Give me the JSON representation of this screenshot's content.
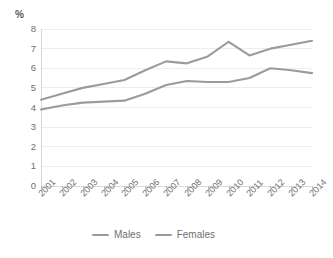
{
  "chart_data": {
    "type": "line",
    "title": "",
    "subtitle": "",
    "xlabel": "",
    "ylabel": "%",
    "unit_label": "%",
    "categories": [
      "2001",
      "2002",
      "2003",
      "2004",
      "2005",
      "2006",
      "2007",
      "2008",
      "2009",
      "2010",
      "2011",
      "2012",
      "2013",
      "2014"
    ],
    "x": [
      2001,
      2002,
      2003,
      2004,
      2005,
      2006,
      2007,
      2008,
      2009,
      2010,
      2011,
      2012,
      2013,
      2014
    ],
    "series": [
      {
        "name": "Males",
        "color": "#9b9b9b",
        "values": [
          4.4,
          4.7,
          5.0,
          5.2,
          5.4,
          5.9,
          6.35,
          6.25,
          6.6,
          7.35,
          6.65,
          7.0,
          7.2,
          7.4
        ]
      },
      {
        "name": "Females",
        "color": "#9b9b9b",
        "values": [
          3.9,
          4.1,
          4.25,
          4.3,
          4.35,
          4.7,
          5.15,
          5.35,
          5.3,
          5.3,
          5.5,
          6.0,
          5.9,
          5.75
        ]
      }
    ],
    "ylim": [
      0,
      8
    ],
    "yticks": [
      0,
      1,
      2,
      3,
      4,
      5,
      6,
      7,
      8
    ],
    "ytick_labels": [
      "0",
      "1",
      "2",
      "3",
      "4",
      "5",
      "6",
      "7",
      "8"
    ],
    "grid": true,
    "grid_axis": "y",
    "legend_position": "bottom",
    "xtick_label_rotation": -45
  },
  "legend": {
    "entries": [
      {
        "label": "Males"
      },
      {
        "label": "Females"
      }
    ]
  },
  "colors": {
    "line": "#9b9b9b",
    "gridline": "#ededed",
    "axis": "#d6d6d6",
    "text": "#6f6f6f",
    "background": "#ffffff"
  }
}
